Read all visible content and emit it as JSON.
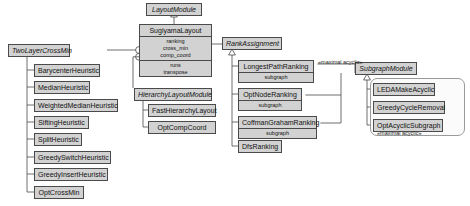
{
  "diagram": {
    "colors": {
      "node_fill": "#d2d2d2",
      "node_border": "#4a4a4a",
      "group_fill": "#fbfbfb",
      "group_border": "#9a9a9a",
      "edge": "#4a4a4a",
      "background": "#ffffff"
    }
  },
  "nodes": {
    "layout_module": {
      "name": "LayoutModule",
      "abstract": true
    },
    "sugiyama_layout": {
      "name": "SugiyamaLayout",
      "abstract": false,
      "attributes_1": [
        "ranking",
        "cross_min",
        "comp_coord"
      ],
      "attributes_2": [
        "runs",
        "transpose"
      ]
    },
    "two_layer_cross_min": {
      "name": "TwoLayerCrossMin",
      "abstract": true
    },
    "barycenter_heuristic": {
      "name": "BarycenterHeuristic",
      "abstract": false
    },
    "median_heuristic": {
      "name": "MedianHeuristic",
      "abstract": false
    },
    "weighted_median_heuristic": {
      "name": "WeightedMedianHeuristic",
      "abstract": false
    },
    "sifting_heuristic": {
      "name": "SiftingHeuristic",
      "abstract": false
    },
    "split_heuristic": {
      "name": "SplitHeuristic",
      "abstract": false
    },
    "greedy_switch_heuristic": {
      "name": "GreedySwitchHeuristic",
      "abstract": false
    },
    "greedy_insert_heuristic": {
      "name": "GreedyInsertHeuristic",
      "abstract": false
    },
    "opt_cross_min": {
      "name": "OptCrossMin",
      "abstract": false
    },
    "hierarchy_layout_module": {
      "name": "HierarchyLayoutModule",
      "abstract": true
    },
    "fast_hierarchy_layout": {
      "name": "FastHierarchyLayout",
      "abstract": false
    },
    "opt_comp_coord": {
      "name": "OptCompCoord",
      "abstract": false
    },
    "rank_assignment": {
      "name": "RankAssignment",
      "abstract": true
    },
    "longest_path_ranking": {
      "name": "LongestPathRanking",
      "abstract": false,
      "attributes_1": [
        "subgraph"
      ]
    },
    "opt_node_ranking": {
      "name": "OptNodeRanking",
      "abstract": false,
      "attributes_1": [
        "subgraph"
      ]
    },
    "coffman_graham_ranking": {
      "name": "CoffmanGrahamRanking",
      "abstract": false,
      "attributes_1": [
        "subgraph"
      ]
    },
    "dfs_ranking": {
      "name": "DfsRanking",
      "abstract": false
    },
    "subgraph_module": {
      "name": "SubgraphModule",
      "abstract": true
    },
    "leda_make_acyclic": {
      "name": "LEDAMakeAcyclic",
      "abstract": false
    },
    "greedy_cycle_removal": {
      "name": "GreedyCycleRemoval",
      "abstract": false
    },
    "opt_acyclic_subgraph": {
      "name": "OptAcyclicSubgraph",
      "abstract": false
    }
  },
  "stereotypes": {
    "maximal_acyclic_edge": "«maximal acyclic»",
    "maximal_acyclic_group": "«maximal acyclic»"
  }
}
